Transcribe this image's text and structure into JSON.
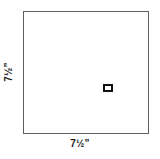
{
  "diagram": {
    "type": "dimensioned-square-panel",
    "background_color": "#ffffff",
    "outline_color": "#5d5f63",
    "mark_color": "#121212",
    "panel": {
      "name": "square-panel",
      "width_label": {
        "whole": "7",
        "fraction": "½",
        "unit": "”",
        "full_text": "7½”"
      },
      "height_label": {
        "whole": "7",
        "fraction": "½",
        "unit": "”",
        "full_text": "7½”"
      }
    },
    "center_feature": {
      "name": "center-cutout",
      "shape": "rectangle",
      "label": ""
    }
  }
}
